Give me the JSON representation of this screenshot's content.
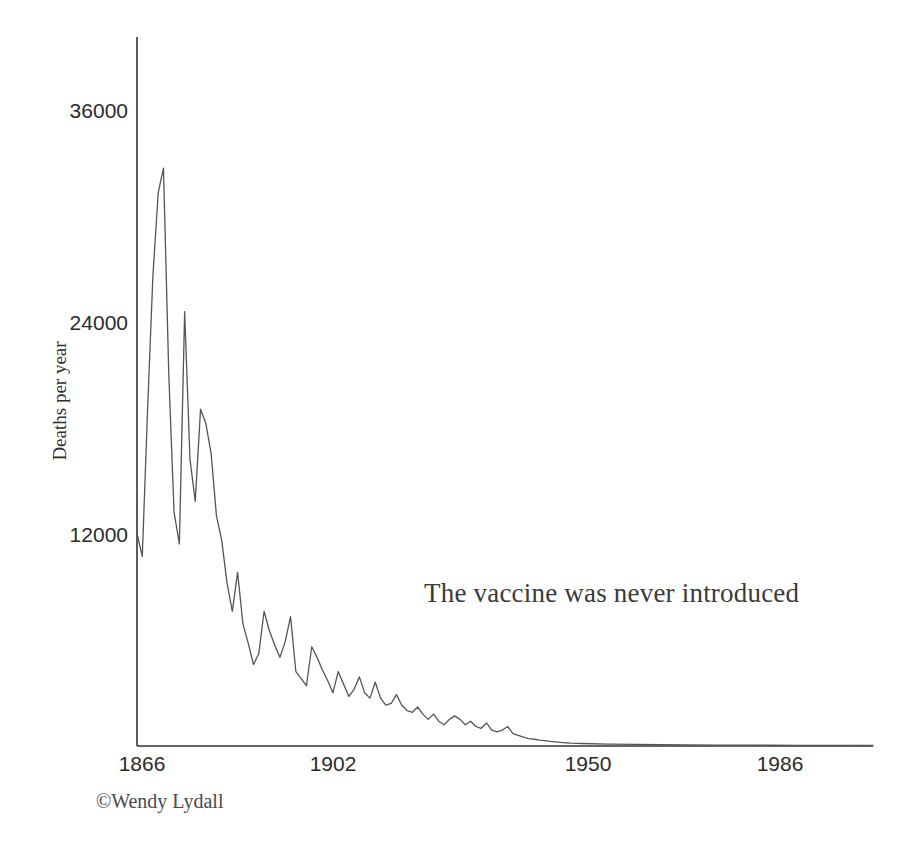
{
  "chart_data": {
    "type": "line",
    "title": "",
    "xlabel": "",
    "ylabel": "Deaths per year",
    "annotation": "The vaccine was never introduced",
    "credit": "©Wendy Lydall",
    "grid": false,
    "legend": "none",
    "xlim": [
      1866,
      2005
    ],
    "ylim": [
      0,
      40000
    ],
    "xticks": [
      1866,
      1902,
      1950,
      1986
    ],
    "xtick_labels": [
      "1866",
      "1902",
      "1950",
      "1986"
    ],
    "yticks": [
      12000,
      24000,
      36000
    ],
    "ytick_labels": [
      "12000",
      "24000",
      "36000"
    ],
    "line_color": "#555555",
    "axis_color": "#333333",
    "x": [
      1866,
      1867,
      1868,
      1869,
      1870,
      1871,
      1872,
      1873,
      1874,
      1875,
      1876,
      1877,
      1878,
      1879,
      1880,
      1881,
      1882,
      1883,
      1884,
      1885,
      1886,
      1887,
      1888,
      1889,
      1890,
      1891,
      1892,
      1893,
      1894,
      1895,
      1896,
      1897,
      1898,
      1899,
      1900,
      1901,
      1902,
      1903,
      1904,
      1905,
      1906,
      1907,
      1908,
      1909,
      1910,
      1911,
      1912,
      1913,
      1914,
      1915,
      1916,
      1917,
      1918,
      1919,
      1920,
      1921,
      1922,
      1923,
      1924,
      1925,
      1926,
      1927,
      1928,
      1929,
      1930,
      1931,
      1932,
      1933,
      1934,
      1935,
      1936,
      1937,
      1938,
      1939,
      1940,
      1941,
      1942,
      1943,
      1944,
      1945,
      1946,
      1947,
      1948,
      1949,
      1950,
      1955,
      1960,
      1965,
      1970,
      1975,
      1980,
      1986,
      1990,
      1995,
      2000,
      2005
    ],
    "values": [
      12000,
      10700,
      19000,
      26500,
      31200,
      32600,
      21000,
      13200,
      11400,
      24500,
      16200,
      13800,
      19000,
      18200,
      16500,
      13000,
      11600,
      9200,
      7600,
      9800,
      6900,
      5800,
      4600,
      5200,
      7600,
      6500,
      5700,
      5000,
      5900,
      7300,
      4200,
      3800,
      3400,
      5600,
      5000,
      4300,
      3700,
      3000,
      4200,
      3500,
      2800,
      3200,
      3900,
      3000,
      2700,
      3600,
      2700,
      2300,
      2400,
      2900,
      2300,
      2000,
      1900,
      2200,
      1800,
      1500,
      1800,
      1400,
      1200,
      1500,
      1700,
      1500,
      1200,
      1400,
      1100,
      1000,
      1300,
      900,
      800,
      900,
      1100,
      700,
      600,
      500,
      420,
      380,
      330,
      300,
      260,
      230,
      200,
      180,
      160,
      150,
      140,
      110,
      90,
      75,
      65,
      55,
      48,
      42,
      38,
      34,
      30,
      28
    ]
  },
  "axes": {
    "x_axis_name": "x-axis",
    "y_axis_name": "y-axis"
  }
}
